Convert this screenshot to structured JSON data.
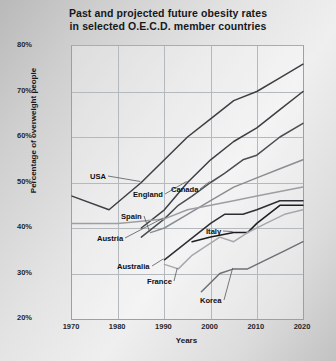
{
  "chart_data": {
    "type": "line",
    "title": "Past and projected future obesity rates in selected O.E.C.D. member countries",
    "title_line1": "Past and projected future obesity rates",
    "title_line2": "in selected O.E.C.D. member countries",
    "xlabel": "Years",
    "ylabel": "Percentage of overweight people",
    "xlim": [
      1970,
      2020
    ],
    "ylim": [
      20,
      80
    ],
    "grid": true,
    "legend": "inline-labels",
    "xticks": [
      "1970",
      "1980",
      "1990",
      "2000",
      "2010",
      "2020"
    ],
    "yticks": [
      "20%",
      "30%",
      "40%",
      "50%",
      "60%",
      "70%",
      "80%"
    ],
    "series": [
      {
        "name": "USA",
        "color": "#3c3f44",
        "x": [
          1970,
          1978,
          1985,
          1990,
          1995,
          2000,
          2005,
          2010,
          2015,
          2020
        ],
        "values": [
          47,
          44,
          50,
          55,
          60,
          64,
          68,
          70,
          73,
          76
        ]
      },
      {
        "name": "England",
        "color": "#3c3f44",
        "x": [
          1985,
          1990,
          1995,
          2000,
          2005,
          2010,
          2015,
          2020
        ],
        "values": [
          40,
          44,
          50,
          55,
          59,
          62,
          66,
          70
        ]
      },
      {
        "name": "Canada",
        "color": "#4a4d52",
        "x": [
          1985,
          1990,
          1993,
          1996,
          2000,
          2003,
          2007,
          2010,
          2015,
          2020
        ],
        "values": [
          38,
          42,
          45,
          47,
          50,
          52,
          55,
          56,
          60,
          63
        ]
      },
      {
        "name": "Spain",
        "color": "#8a8d92",
        "x": [
          1987,
          1990,
          1995,
          2000,
          2005,
          2010,
          2015,
          2020
        ],
        "values": [
          39,
          40,
          43,
          46,
          49,
          51,
          53,
          55
        ]
      },
      {
        "name": "Austria",
        "color": "#9b9ea3",
        "x": [
          1970,
          1980,
          1990,
          1995,
          2000,
          2005,
          2010,
          2015,
          2020
        ],
        "values": [
          41,
          41,
          42,
          44,
          45,
          46,
          47,
          48,
          49
        ]
      },
      {
        "name": "Australia",
        "color": "#2b2e33",
        "x": [
          1990,
          1995,
          2000,
          2003,
          2007,
          2010,
          2015,
          2020
        ],
        "values": [
          33,
          37,
          41,
          43,
          43,
          44,
          46,
          46
        ]
      },
      {
        "name": "Italy",
        "color": "#1b1d21",
        "x": [
          1996,
          2000,
          2005,
          2008,
          2010,
          2015,
          2020
        ],
        "values": [
          37,
          38,
          39,
          39,
          41,
          45,
          45
        ]
      },
      {
        "name": "France",
        "color": "#a5a8ad",
        "x": [
          1990,
          1993,
          1996,
          1999,
          2002,
          2005,
          2008,
          2012,
          2016,
          2020
        ],
        "values": [
          32,
          31,
          34,
          36,
          38,
          37,
          39,
          41,
          43,
          44
        ]
      },
      {
        "name": "Korea",
        "color": "#6d7075",
        "x": [
          1998,
          2002,
          2005,
          2008,
          2012,
          2016,
          2020
        ],
        "values": [
          26,
          30,
          31,
          31,
          33,
          35,
          37
        ]
      }
    ],
    "annotations": [
      {
        "label": "USA",
        "x_px": 90,
        "y_px": 172
      },
      {
        "label": "England",
        "x_px": 133,
        "y_px": 190
      },
      {
        "label": "Canada",
        "x_px": 171,
        "y_px": 185
      },
      {
        "label": "Spain",
        "x_px": 121,
        "y_px": 212
      },
      {
        "label": "Austria",
        "x_px": 97,
        "y_px": 234
      },
      {
        "label": "Italy",
        "x_px": 206,
        "y_px": 227
      },
      {
        "label": "Australia",
        "x_px": 117,
        "y_px": 262
      },
      {
        "label": "France",
        "x_px": 147,
        "y_px": 277
      },
      {
        "label": "Korea",
        "x_px": 200,
        "y_px": 296
      }
    ]
  }
}
